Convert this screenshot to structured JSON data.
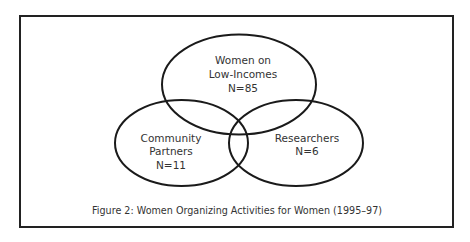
{
  "diagram": {
    "type": "venn",
    "sets": [
      {
        "name": "Women on Low-Incomes",
        "lines": [
          "Women on",
          "Low-Incomes",
          "N=85"
        ],
        "n": 85
      },
      {
        "name": "Community Partners",
        "lines": [
          "Community",
          "Partners",
          "N=11"
        ],
        "n": 11
      },
      {
        "name": "Researchers",
        "lines": [
          "Researchers",
          "N=6"
        ],
        "n": 6
      }
    ],
    "caption": "Figure 2: Women Organizing Activities for Women (1995–97)"
  }
}
